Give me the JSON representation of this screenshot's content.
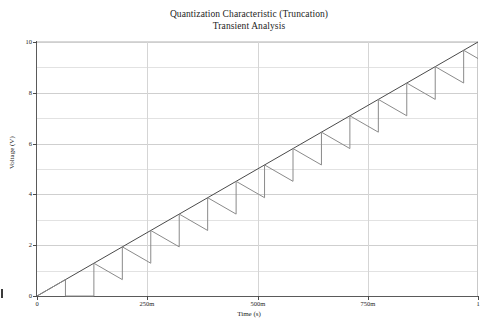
{
  "window": {
    "title": "Quantization Characteristic (Truncation) — Transient Analysis"
  },
  "chart_data": {
    "type": "line",
    "title": "Quantization Characteristic (Truncation)",
    "subtitle": "Transient Analysis",
    "title_lines": [
      "Quantization Characteristic (Truncation)",
      "Transient Analysis"
    ],
    "xlabel": "Time (s)",
    "ylabel": "Voltage (V)",
    "xlim": [
      0,
      1
    ],
    "ylim": [
      0,
      10
    ],
    "grid": true,
    "legend": null,
    "legend_position": "none",
    "x_ticks": [
      {
        "value": 0,
        "label": "0"
      },
      {
        "value": 0.25,
        "label": "250m"
      },
      {
        "value": 0.5,
        "label": "500m"
      },
      {
        "value": 0.75,
        "label": "750m"
      },
      {
        "value": 1,
        "label": "1"
      }
    ],
    "y_ticks": [
      {
        "value": 0,
        "label": "0"
      },
      {
        "value": 2,
        "label": "2"
      },
      {
        "value": 4,
        "label": "4"
      },
      {
        "value": 6,
        "label": "6"
      },
      {
        "value": 8,
        "label": "8"
      },
      {
        "value": 10,
        "label": "10"
      }
    ],
    "y_minor_ticks": [
      1,
      3,
      5,
      7,
      9
    ],
    "series": [
      {
        "name": "ramp-input",
        "kind": "line",
        "color": "#4a4a4a",
        "width": 1,
        "comment": "Ideal linear ramp reference 0 V to 10 V over 0 s to 1 s",
        "x": [
          0,
          1
        ],
        "values": [
          0,
          10
        ]
      },
      {
        "name": "quantized-output",
        "kind": "step-sawtooth",
        "color": "#8a8a8a",
        "width": 1,
        "comment": "Truncation quantizer residue: output climbs with the ramp then drops one LSB at each quantization boundary and holds flat.",
        "step_count": 15,
        "step_period_s": 0.0645,
        "lsb_volts": 0.645,
        "segments": [
          {
            "x0": 0.0,
            "y0": 0.0,
            "x1": 0.0645,
            "y1": 0.645
          },
          {
            "x0": 0.0645,
            "y0": 0.645,
            "x1": 0.0645,
            "y1": 0.0
          },
          {
            "x0": 0.0645,
            "y0": 0.0,
            "x1": 0.129,
            "y1": 0.0
          },
          {
            "x0": 0.129,
            "y0": 0.0,
            "x1": 0.129,
            "y1": 1.29
          },
          {
            "x0": 0.129,
            "y0": 1.29,
            "x1": 0.1935,
            "y1": 0.645
          },
          {
            "x0": 0.1935,
            "y0": 0.645,
            "x1": 0.1935,
            "y1": 1.935
          },
          {
            "x0": 0.1935,
            "y0": 1.935,
            "x1": 0.258,
            "y1": 1.29
          },
          {
            "x0": 0.258,
            "y0": 1.29,
            "x1": 0.258,
            "y1": 2.58
          },
          {
            "x0": 0.258,
            "y0": 2.58,
            "x1": 0.3225,
            "y1": 1.935
          },
          {
            "x0": 0.3225,
            "y0": 1.935,
            "x1": 0.3225,
            "y1": 3.225
          },
          {
            "x0": 0.3225,
            "y0": 3.225,
            "x1": 0.387,
            "y1": 2.58
          },
          {
            "x0": 0.387,
            "y0": 2.58,
            "x1": 0.387,
            "y1": 3.87
          },
          {
            "x0": 0.387,
            "y0": 3.87,
            "x1": 0.4515,
            "y1": 3.225
          },
          {
            "x0": 0.4515,
            "y0": 3.225,
            "x1": 0.4515,
            "y1": 4.515
          },
          {
            "x0": 0.4515,
            "y0": 4.515,
            "x1": 0.516,
            "y1": 3.87
          },
          {
            "x0": 0.516,
            "y0": 3.87,
            "x1": 0.516,
            "y1": 5.16
          },
          {
            "x0": 0.516,
            "y0": 5.16,
            "x1": 0.5805,
            "y1": 4.515
          },
          {
            "x0": 0.5805,
            "y0": 4.515,
            "x1": 0.5805,
            "y1": 5.805
          },
          {
            "x0": 0.5805,
            "y0": 5.805,
            "x1": 0.645,
            "y1": 5.16
          },
          {
            "x0": 0.645,
            "y0": 5.16,
            "x1": 0.645,
            "y1": 6.45
          },
          {
            "x0": 0.645,
            "y0": 6.45,
            "x1": 0.7095,
            "y1": 5.805
          },
          {
            "x0": 0.7095,
            "y0": 5.805,
            "x1": 0.7095,
            "y1": 7.095
          },
          {
            "x0": 0.7095,
            "y0": 7.095,
            "x1": 0.774,
            "y1": 6.45
          },
          {
            "x0": 0.774,
            "y0": 6.45,
            "x1": 0.774,
            "y1": 7.74
          },
          {
            "x0": 0.774,
            "y0": 7.74,
            "x1": 0.8385,
            "y1": 7.095
          },
          {
            "x0": 0.8385,
            "y0": 7.095,
            "x1": 0.8385,
            "y1": 8.385
          },
          {
            "x0": 0.8385,
            "y0": 8.385,
            "x1": 0.903,
            "y1": 7.74
          },
          {
            "x0": 0.903,
            "y0": 7.74,
            "x1": 0.903,
            "y1": 9.03
          },
          {
            "x0": 0.903,
            "y0": 9.03,
            "x1": 0.9675,
            "y1": 8.385
          },
          {
            "x0": 0.9675,
            "y0": 8.385,
            "x1": 0.9675,
            "y1": 9.675
          },
          {
            "x0": 0.9675,
            "y0": 9.675,
            "x1": 1.0,
            "y1": 9.35
          }
        ]
      }
    ]
  }
}
